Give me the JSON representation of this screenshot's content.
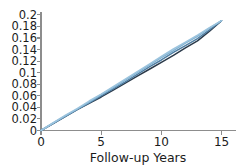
{
  "chart_data": {
    "type": "line",
    "title": "",
    "subtitle": "",
    "xlabel": "Follow-up Years",
    "ylabel": "",
    "xlim": [
      0,
      16.2
    ],
    "ylim": [
      0,
      0.205
    ],
    "grid": false,
    "legend": "none",
    "annotations": [],
    "xticks": [
      0,
      5,
      10,
      15
    ],
    "xtick_labels": [
      "0",
      "5",
      "10",
      "15"
    ],
    "yticks": [
      0,
      0.02,
      0.04,
      0.06,
      0.08,
      0.1,
      0.12,
      0.14,
      0.16,
      0.18,
      0.2
    ],
    "ytick_labels": [
      "0",
      "0.02",
      "0.04",
      "0.06",
      "0.08",
      "0.1",
      "0.12",
      "0.14",
      "0.16",
      "0.18",
      "0.2"
    ],
    "x": [
      0,
      1,
      2,
      3,
      4,
      5,
      6,
      7,
      8,
      9,
      10,
      11,
      12,
      13,
      14,
      15
    ],
    "series": [
      {
        "name": "curve-1",
        "color": "#2b3a4a",
        "width": 1.5,
        "values": [
          0.0,
          0.012,
          0.024,
          0.036,
          0.047,
          0.058,
          0.07,
          0.082,
          0.094,
          0.106,
          0.118,
          0.13,
          0.143,
          0.155,
          0.172,
          0.19
        ]
      },
      {
        "name": "curve-2",
        "color": "#4f7ea3",
        "width": 1.5,
        "values": [
          0.0,
          0.012,
          0.024,
          0.036,
          0.048,
          0.06,
          0.072,
          0.084,
          0.097,
          0.11,
          0.122,
          0.135,
          0.147,
          0.159,
          0.174,
          0.19
        ]
      },
      {
        "name": "curve-3",
        "color": "#7fb0d0",
        "width": 1.5,
        "values": [
          0.0,
          0.013,
          0.025,
          0.037,
          0.049,
          0.062,
          0.074,
          0.087,
          0.1,
          0.113,
          0.126,
          0.138,
          0.151,
          0.163,
          0.177,
          0.19
        ]
      },
      {
        "name": "curve-4",
        "color": "#9cc4de",
        "width": 1.5,
        "values": [
          0.0,
          0.013,
          0.026,
          0.038,
          0.051,
          0.063,
          0.076,
          0.089,
          0.102,
          0.115,
          0.128,
          0.141,
          0.153,
          0.165,
          0.178,
          0.19
        ]
      }
    ]
  },
  "axes": {
    "spine_color": "#8d8d8d",
    "text_color": "#1b1b1b"
  }
}
